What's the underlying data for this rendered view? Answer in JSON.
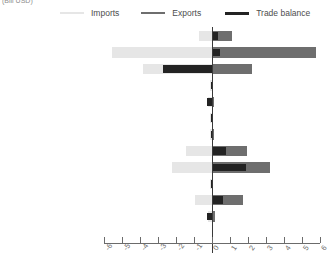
{
  "chart_data": {
    "type": "bar",
    "orientation": "horizontal",
    "title": "",
    "subtitle": "",
    "unit_caption": "(Bill USD)",
    "xlabel": "",
    "ylabel": "",
    "xlim": [
      -6,
      6
    ],
    "grid": false,
    "legend_position": "top",
    "xticks": [
      -6,
      -5,
      -4,
      -3,
      -2,
      -1,
      0,
      1,
      2,
      3,
      4,
      5,
      6
    ],
    "xticklabels": [
      "-6",
      "-5",
      "-4",
      "-3",
      "-2",
      "-1",
      "0",
      "1",
      "2",
      "3",
      "4",
      "5",
      "6"
    ],
    "categories": [
      "Developed Asia-Pacific",
      "Developed Europe",
      "Developed N. America",
      "South-eastern Europe",
      "C I S",
      "Northern Africa",
      "Sub-Saharan Africa",
      "Latin Am, Caribbean",
      "Eastern Asia",
      "Southern Asia",
      "South-eastern Asia",
      "Western Asia",
      "Oceania"
    ],
    "series": [
      {
        "name": "Imports",
        "color": "#e6e6e6",
        "values": [
          -0.75,
          -5.55,
          -3.85,
          -0.1,
          -0.2,
          -0.1,
          -0.12,
          -1.45,
          -2.2,
          -0.1,
          -0.95,
          -0.25,
          -0.02
        ]
      },
      {
        "name": "Exports",
        "color": "#6e6e6e",
        "values": [
          1.1,
          5.8,
          2.2,
          0.08,
          0.12,
          0.08,
          0.1,
          1.95,
          3.2,
          0.08,
          1.7,
          0.18,
          0.02
        ]
      },
      {
        "name": "Trade balance",
        "color": "#232323",
        "values": [
          0.35,
          0.45,
          -2.75,
          -0.05,
          -0.3,
          -0.04,
          -0.06,
          0.8,
          1.9,
          -0.05,
          0.6,
          -0.3,
          0.0
        ]
      }
    ]
  },
  "legend": {
    "entries": [
      {
        "label": "Imports",
        "color": "#e6e6e6"
      },
      {
        "label": "Exports",
        "color": "#6e6e6e"
      },
      {
        "label": "Trade balance",
        "color": "#232323"
      }
    ]
  }
}
